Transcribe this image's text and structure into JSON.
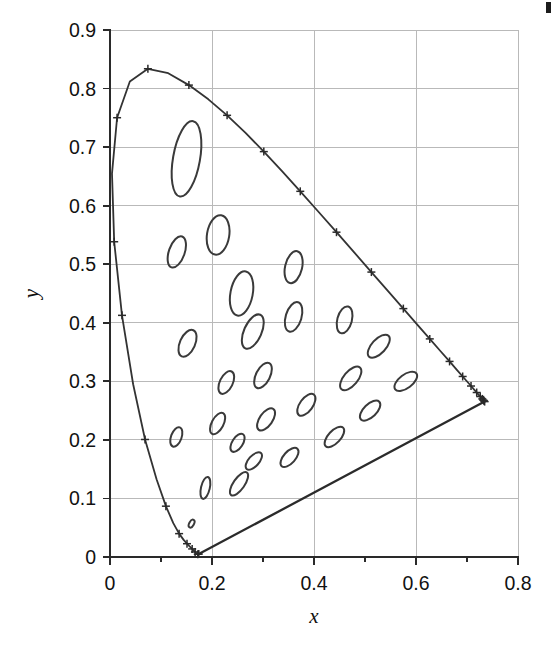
{
  "figure": {
    "kind": "cie-1931-chromaticity-diagram-with-macadam-ellipses",
    "background_color": "#ffffff",
    "ink_color": "#333333",
    "grid_color": "#b9b9b9"
  },
  "chart_data": {
    "type": "scatter",
    "title": "",
    "xlabel": "x",
    "ylabel": "y",
    "xlim": [
      0,
      0.8
    ],
    "ylim": [
      0,
      0.9
    ],
    "grid": true,
    "legend": "none",
    "xticks": [
      0,
      0.2,
      0.4,
      0.6,
      0.8
    ],
    "xtick_labels": [
      "0",
      "0.2",
      "0.4",
      "0.6",
      "0.8"
    ],
    "yticks": [
      0,
      0.1,
      0.2,
      0.3,
      0.4,
      0.5,
      0.6,
      0.7,
      0.8,
      0.9
    ],
    "ytick_labels": [
      "0",
      "0.1",
      "0.2",
      "0.3",
      "0.4",
      "0.5",
      "0.6",
      "0.7",
      "0.8",
      "0.9"
    ],
    "x_minor_ticks": [
      0.1,
      0.3,
      0.5,
      0.7
    ],
    "series": [
      {
        "name": "spectral-locus",
        "type": "line",
        "marker": "plus",
        "points": [
          [
            0.1741,
            0.005
          ],
          [
            0.174,
            0.005
          ],
          [
            0.1738,
            0.0049
          ],
          [
            0.1736,
            0.0049
          ],
          [
            0.1733,
            0.0048
          ],
          [
            0.173,
            0.0048
          ],
          [
            0.1726,
            0.0048
          ],
          [
            0.1721,
            0.0048
          ],
          [
            0.1714,
            0.0051
          ],
          [
            0.1703,
            0.0058
          ],
          [
            0.1689,
            0.0069
          ],
          [
            0.1669,
            0.0086
          ],
          [
            0.1644,
            0.0109
          ],
          [
            0.1611,
            0.0138
          ],
          [
            0.1566,
            0.0177
          ],
          [
            0.151,
            0.0227
          ],
          [
            0.144,
            0.0297
          ],
          [
            0.1355,
            0.0399
          ],
          [
            0.1241,
            0.0578
          ],
          [
            0.1096,
            0.0868
          ],
          [
            0.0913,
            0.1327
          ],
          [
            0.0687,
            0.2007
          ],
          [
            0.0454,
            0.295
          ],
          [
            0.0235,
            0.4127
          ],
          [
            0.0082,
            0.5384
          ],
          [
            0.0039,
            0.6548
          ],
          [
            0.0139,
            0.7502
          ],
          [
            0.0389,
            0.812
          ],
          [
            0.0743,
            0.8338
          ],
          [
            0.1142,
            0.8262
          ],
          [
            0.1547,
            0.8059
          ],
          [
            0.1929,
            0.7816
          ],
          [
            0.2296,
            0.7543
          ],
          [
            0.2658,
            0.7243
          ],
          [
            0.3016,
            0.6923
          ],
          [
            0.3373,
            0.6589
          ],
          [
            0.3731,
            0.6245
          ],
          [
            0.4087,
            0.5896
          ],
          [
            0.4441,
            0.5547
          ],
          [
            0.4788,
            0.5202
          ],
          [
            0.5125,
            0.4866
          ],
          [
            0.5448,
            0.4544
          ],
          [
            0.5752,
            0.4242
          ],
          [
            0.6029,
            0.3965
          ],
          [
            0.627,
            0.3725
          ],
          [
            0.6482,
            0.3514
          ],
          [
            0.6658,
            0.334
          ],
          [
            0.6801,
            0.3197
          ],
          [
            0.6915,
            0.3083
          ],
          [
            0.7006,
            0.2993
          ],
          [
            0.7079,
            0.292
          ],
          [
            0.714,
            0.2859
          ],
          [
            0.719,
            0.2809
          ],
          [
            0.723,
            0.277
          ],
          [
            0.726,
            0.274
          ],
          [
            0.7283,
            0.2717
          ],
          [
            0.73,
            0.27
          ],
          [
            0.7311,
            0.2689
          ],
          [
            0.732,
            0.268
          ],
          [
            0.7327,
            0.2673
          ],
          [
            0.7334,
            0.2666
          ],
          [
            0.734,
            0.266
          ],
          [
            0.7344,
            0.2656
          ],
          [
            0.7346,
            0.2654
          ]
        ],
        "wavelength_marks": [
          [
            0.1741,
            0.005
          ],
          [
            0.1721,
            0.0048
          ],
          [
            0.1669,
            0.0086
          ],
          [
            0.1611,
            0.0138
          ],
          [
            0.151,
            0.0227
          ],
          [
            0.1355,
            0.0399
          ],
          [
            0.1096,
            0.0868
          ],
          [
            0.0687,
            0.2007
          ],
          [
            0.0235,
            0.4127
          ],
          [
            0.0082,
            0.5384
          ],
          [
            0.0139,
            0.7502
          ],
          [
            0.0743,
            0.8338
          ],
          [
            0.1547,
            0.8059
          ],
          [
            0.2296,
            0.7543
          ],
          [
            0.3016,
            0.6923
          ],
          [
            0.3731,
            0.6245
          ],
          [
            0.4441,
            0.5547
          ],
          [
            0.5125,
            0.4866
          ],
          [
            0.5752,
            0.4242
          ],
          [
            0.627,
            0.3725
          ],
          [
            0.6658,
            0.334
          ],
          [
            0.6915,
            0.3083
          ],
          [
            0.7079,
            0.292
          ],
          [
            0.719,
            0.2809
          ],
          [
            0.726,
            0.274
          ],
          [
            0.73,
            0.27
          ],
          [
            0.732,
            0.268
          ],
          [
            0.7334,
            0.2666
          ],
          [
            0.7346,
            0.2654
          ]
        ]
      },
      {
        "name": "purple-line",
        "type": "line",
        "points": [
          [
            0.1741,
            0.005
          ],
          [
            0.7346,
            0.2654
          ]
        ]
      },
      {
        "name": "macadam-ellipses",
        "type": "ellipse-set",
        "note": "MacAdam just-noticeable-difference ellipses, enlarged 10x",
        "ellipses": [
          {
            "cx": 0.16,
            "cy": 0.057,
            "a": 0.0085,
            "b": 0.004,
            "angle": 62
          },
          {
            "cx": 0.187,
            "cy": 0.118,
            "a": 0.022,
            "b": 0.0075,
            "angle": 77
          },
          {
            "cx": 0.253,
            "cy": 0.125,
            "a": 0.027,
            "b": 0.0095,
            "angle": 55
          },
          {
            "cx": 0.15,
            "cy": 0.68,
            "a": 0.075,
            "b": 0.023,
            "angle": 80
          },
          {
            "cx": 0.131,
            "cy": 0.521,
            "a": 0.032,
            "b": 0.0135,
            "angle": 71
          },
          {
            "cx": 0.212,
            "cy": 0.55,
            "a": 0.039,
            "b": 0.019,
            "angle": 81
          },
          {
            "cx": 0.258,
            "cy": 0.45,
            "a": 0.044,
            "b": 0.019,
            "angle": 79
          },
          {
            "cx": 0.152,
            "cy": 0.365,
            "a": 0.028,
            "b": 0.013,
            "angle": 66
          },
          {
            "cx": 0.28,
            "cy": 0.385,
            "a": 0.036,
            "b": 0.015,
            "angle": 66
          },
          {
            "cx": 0.36,
            "cy": 0.495,
            "a": 0.032,
            "b": 0.0145,
            "angle": 77
          },
          {
            "cx": 0.36,
            "cy": 0.41,
            "a": 0.03,
            "b": 0.0135,
            "angle": 73
          },
          {
            "cx": 0.46,
            "cy": 0.405,
            "a": 0.027,
            "b": 0.0125,
            "angle": 75
          },
          {
            "cx": 0.3,
            "cy": 0.31,
            "a": 0.027,
            "b": 0.012,
            "angle": 63
          },
          {
            "cx": 0.228,
            "cy": 0.298,
            "a": 0.024,
            "b": 0.011,
            "angle": 64
          },
          {
            "cx": 0.13,
            "cy": 0.205,
            "a": 0.02,
            "b": 0.009,
            "angle": 70
          },
          {
            "cx": 0.211,
            "cy": 0.228,
            "a": 0.023,
            "b": 0.01,
            "angle": 62
          },
          {
            "cx": 0.306,
            "cy": 0.235,
            "a": 0.025,
            "b": 0.011,
            "angle": 55
          },
          {
            "cx": 0.385,
            "cy": 0.26,
            "a": 0.025,
            "b": 0.011,
            "angle": 54
          },
          {
            "cx": 0.472,
            "cy": 0.305,
            "a": 0.028,
            "b": 0.012,
            "angle": 50
          },
          {
            "cx": 0.527,
            "cy": 0.36,
            "a": 0.028,
            "b": 0.012,
            "angle": 47
          },
          {
            "cx": 0.58,
            "cy": 0.3,
            "a": 0.026,
            "b": 0.0115,
            "angle": 37
          },
          {
            "cx": 0.51,
            "cy": 0.25,
            "a": 0.025,
            "b": 0.011,
            "angle": 44
          },
          {
            "cx": 0.44,
            "cy": 0.205,
            "a": 0.025,
            "b": 0.0105,
            "angle": 47
          },
          {
            "cx": 0.352,
            "cy": 0.17,
            "a": 0.023,
            "b": 0.01,
            "angle": 48
          },
          {
            "cx": 0.282,
            "cy": 0.164,
            "a": 0.021,
            "b": 0.009,
            "angle": 48
          },
          {
            "cx": 0.25,
            "cy": 0.195,
            "a": 0.02,
            "b": 0.009,
            "angle": 57
          }
        ]
      }
    ]
  },
  "axes": {
    "x_title": "x",
    "y_title": "y"
  }
}
